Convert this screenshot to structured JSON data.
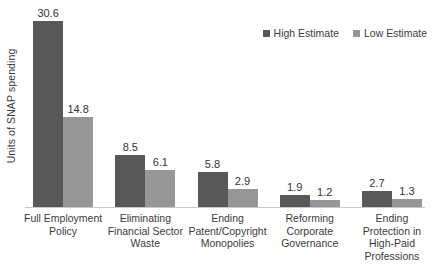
{
  "chart_data": {
    "type": "bar",
    "title": "",
    "subtitle": "",
    "xlabel": "",
    "ylabel": "Units of SNAP spending",
    "ylim": [
      0,
      30.6
    ],
    "grid": false,
    "legend_position": "top-right",
    "categories": [
      "Full Employment Policy",
      "Eliminating Financial Sector Waste",
      "Ending Patent/Copyright Monopolies",
      "Reforming Corporate Governance",
      "Ending Protection in High-Paid Professions"
    ],
    "category_lines": [
      [
        "Full Employment",
        "Policy"
      ],
      [
        "Eliminating",
        "Financial Sector",
        "Waste"
      ],
      [
        "Ending",
        "Patent/Copyright",
        "Monopolies"
      ],
      [
        "Reforming",
        "Corporate",
        "Governance"
      ],
      [
        "Ending",
        "Protection in",
        "High-Paid",
        "Professions"
      ]
    ],
    "series": [
      {
        "name": "High Estimate",
        "color": "#585858",
        "values": [
          30.6,
          8.5,
          5.8,
          1.9,
          2.7
        ],
        "labels": [
          "30.6",
          "8.5",
          "5.8",
          "1.9",
          "2.7"
        ]
      },
      {
        "name": "Low Estimate",
        "color": "#969696",
        "values": [
          14.8,
          6.1,
          2.9,
          1.2,
          1.3
        ],
        "labels": [
          "14.8",
          "6.1",
          "2.9",
          "1.2",
          "1.3"
        ]
      }
    ]
  },
  "legend": {
    "items": [
      {
        "label": "High Estimate",
        "color": "#585858"
      },
      {
        "label": "Low Estimate",
        "color": "#969696"
      }
    ]
  },
  "axis": {
    "y_title": "Units of SNAP spending",
    "axis_line_color": "#c9c9c9"
  },
  "colors": {
    "background": "#ffffff",
    "text": "#3b3b3b",
    "high_estimate": "#585858",
    "low_estimate": "#969696"
  }
}
